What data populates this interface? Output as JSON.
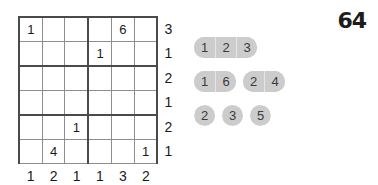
{
  "board": {
    "size": {
      "rows": 6,
      "cols": 6
    },
    "block": {
      "rows": 2,
      "cols": 3
    },
    "cells": [
      [
        "1",
        "",
        "",
        "",
        "6",
        ""
      ],
      [
        "",
        "",
        "",
        "1",
        "",
        ""
      ],
      [
        "",
        "",
        "",
        "",
        "",
        ""
      ],
      [
        "",
        "",
        "",
        "",
        "",
        ""
      ],
      [
        "",
        "",
        "1",
        "",
        "",
        ""
      ],
      [
        "",
        "4",
        "",
        "",
        "",
        "1"
      ]
    ],
    "row_clues": [
      "3",
      "1",
      "2",
      "1",
      "2",
      "1"
    ],
    "col_clues": [
      "1",
      "2",
      "1",
      "1",
      "3",
      "2"
    ]
  },
  "panel": {
    "score": "64",
    "pill_rows": [
      {
        "groups": [
          {
            "joined": true,
            "values": [
              "1",
              "2",
              "3"
            ]
          }
        ]
      },
      {
        "groups": [
          {
            "joined": true,
            "values": [
              "1",
              "6"
            ]
          },
          {
            "joined": true,
            "values": [
              "2",
              "4"
            ]
          }
        ]
      },
      {
        "groups": [
          {
            "joined": false,
            "values": [
              "2",
              "3",
              "5"
            ]
          }
        ]
      }
    ]
  },
  "colors": {
    "pill_fill": "#cccccc",
    "pill_text": "#3a3a3a",
    "grid_thin": "#8d8d8d",
    "grid_thick": "#4a4a4a",
    "text": "#1a1a1a",
    "background": "#ffffff"
  }
}
